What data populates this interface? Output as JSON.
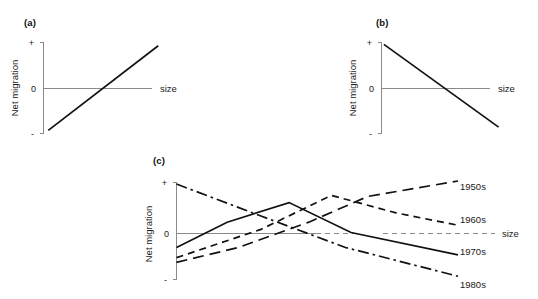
{
  "figure": {
    "caption_letters": {
      "a": "(a)",
      "b": "(b)",
      "c": "(c)"
    },
    "axis": {
      "ylabel": "Net migration",
      "xlabel": "size",
      "tick_plus": "+",
      "tick_zero": "0",
      "tick_minus": "-"
    },
    "colors": {
      "axis": "#8a8a8a",
      "line": "#111111",
      "text": "#1a1a1a",
      "background": "#ffffff"
    }
  },
  "chart_data": [
    {
      "id": "panel-a",
      "type": "line",
      "title": "(a)",
      "xlabel": "size",
      "ylabel": "Net migration",
      "xlim": [
        0,
        100
      ],
      "ylim": [
        -1,
        1
      ],
      "grid": false,
      "legend": "none",
      "yticks": [
        "+",
        "0",
        "-"
      ],
      "ytick_values": [
        1,
        0,
        -1
      ],
      "series": [
        {
          "name": "net migration vs size",
          "style": "solid",
          "x": [
            4,
            96
          ],
          "values": [
            -0.92,
            0.92
          ]
        }
      ],
      "annotation": "Net migration increases monotonically with settlement size"
    },
    {
      "id": "panel-b",
      "type": "line",
      "title": "(b)",
      "xlabel": "size",
      "ylabel": "Net migration",
      "xlim": [
        0,
        100
      ],
      "ylim": [
        -1,
        1
      ],
      "grid": false,
      "legend": "none",
      "yticks": [
        "+",
        "0",
        "-"
      ],
      "ytick_values": [
        1,
        0,
        -1
      ],
      "series": [
        {
          "name": "net migration vs size",
          "style": "solid",
          "x": [
            2,
            98
          ],
          "values": [
            0.95,
            -0.85
          ]
        }
      ],
      "annotation": "Net migration decreases monotonically with settlement size"
    },
    {
      "id": "panel-c",
      "type": "line",
      "title": "(c)",
      "xlabel": "size",
      "ylabel": "Net migration",
      "xlim": [
        0,
        100
      ],
      "ylim": [
        -1,
        1
      ],
      "grid": false,
      "legend": "right",
      "yticks": [
        "+",
        "0",
        "-"
      ],
      "ytick_values": [
        1,
        0,
        -1
      ],
      "series": [
        {
          "name": "1950s",
          "label": "1950s",
          "style": "long-dash",
          "x": [
            0,
            22,
            47,
            68,
            100
          ],
          "values": [
            -0.62,
            -0.3,
            0.22,
            0.72,
            1.02
          ]
        },
        {
          "name": "1960s",
          "label": "1960s",
          "style": "dashed",
          "x": [
            0,
            30,
            55,
            78,
            100
          ],
          "values": [
            -0.52,
            0.08,
            0.74,
            0.4,
            0.16
          ]
        },
        {
          "name": "1970s",
          "label": "1970s",
          "style": "solid",
          "x": [
            0,
            18,
            40,
            62,
            100
          ],
          "values": [
            -0.3,
            0.22,
            0.6,
            0.02,
            -0.46
          ]
        },
        {
          "name": "1980s",
          "label": "1980s",
          "style": "dash-dot",
          "x": [
            0,
            30,
            60,
            100
          ],
          "values": [
            0.96,
            0.34,
            -0.3,
            -0.92
          ]
        }
      ],
      "legend_entries": [
        "1950s",
        "1960s",
        "1970s",
        "1980s"
      ],
      "annotation": "Relationship between net migration and settlement size shifts by decade"
    }
  ]
}
